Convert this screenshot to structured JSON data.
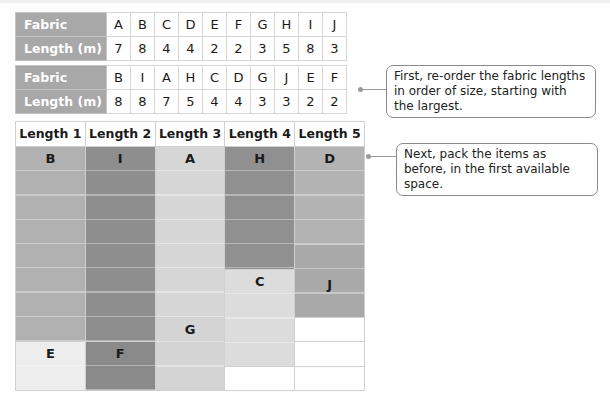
{
  "original_table": {
    "row_labels": [
      "Fabric",
      "Length (m)"
    ],
    "fabrics": [
      "A",
      "B",
      "C",
      "D",
      "E",
      "F",
      "G",
      "H",
      "I",
      "J"
    ],
    "lengths": [
      "7",
      "8",
      "4",
      "4",
      "2",
      "2",
      "3",
      "5",
      "8",
      "3"
    ]
  },
  "sorted_table": {
    "row_labels": [
      "Fabric",
      "Length (m)"
    ],
    "fabrics": [
      "B",
      "I",
      "A",
      "H",
      "C",
      "D",
      "G",
      "J",
      "E",
      "F"
    ],
    "lengths": [
      "8",
      "8",
      "7",
      "5",
      "4",
      "4",
      "3",
      "3",
      "2",
      "2"
    ]
  },
  "packing_grid": {
    "column_headers": [
      "Length 1",
      "Length 2",
      "Length 3",
      "Length 4",
      "Length 5"
    ],
    "total_rows": 10,
    "columns": [
      {
        "pieces": [
          {
            "label": "B",
            "size": 8,
            "color": "#b1b1b1"
          },
          {
            "label": "E",
            "size": 2,
            "color": "#ededed"
          }
        ],
        "empty": 0
      },
      {
        "pieces": [
          {
            "label": "I",
            "size": 8,
            "color": "#8e8e8e"
          },
          {
            "label": "F",
            "size": 2,
            "color": "#8a8a8a"
          }
        ],
        "empty": 0
      },
      {
        "pieces": [
          {
            "label": "A",
            "size": 7,
            "color": "#d6d6d6"
          },
          {
            "label": "G",
            "size": 3,
            "color": "#d4d4d4"
          }
        ],
        "empty": 0
      },
      {
        "pieces": [
          {
            "label": "H",
            "size": 5,
            "color": "#909090"
          },
          {
            "label": "C",
            "size": 4,
            "color": "#dcdcdc"
          }
        ],
        "empty": 1
      },
      {
        "pieces": [
          {
            "label": "D",
            "size": 4,
            "color": "#b3b3b3"
          },
          {
            "label": "J",
            "size": 3,
            "color": "#a9a9a9"
          }
        ],
        "empty": 3
      }
    ]
  },
  "callouts": [
    {
      "text": "First, re-order the fabric lengths in order of size, starting with the largest."
    },
    {
      "text": "Next, pack the items as before, in the first available space."
    }
  ]
}
